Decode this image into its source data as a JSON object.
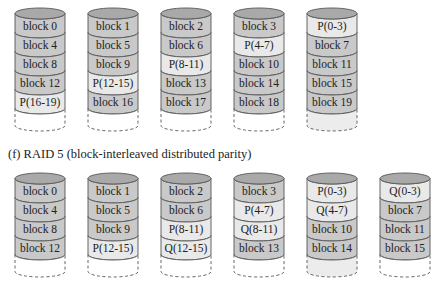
{
  "colors": {
    "data_block": "#c9c9c9",
    "parity_block": "#e9e9e9",
    "cap": "#a9a9a9",
    "outline": "#555555",
    "empty": "#ffffff",
    "empty_parity": "#ececec"
  },
  "raid5": {
    "disks": [
      {
        "blocks": [
          {
            "label": "block 0",
            "type": "data"
          },
          {
            "label": "block 4",
            "type": "data"
          },
          {
            "label": "block 8",
            "type": "data"
          },
          {
            "label": "block 12",
            "type": "data"
          },
          {
            "label": "P(16-19)",
            "type": "parity"
          }
        ],
        "tail": "empty"
      },
      {
        "blocks": [
          {
            "label": "block 1",
            "type": "data"
          },
          {
            "label": "block 5",
            "type": "data"
          },
          {
            "label": "block 9",
            "type": "data"
          },
          {
            "label": "P(12-15)",
            "type": "parity"
          },
          {
            "label": "block 16",
            "type": "data"
          }
        ],
        "tail": "empty"
      },
      {
        "blocks": [
          {
            "label": "block 2",
            "type": "data"
          },
          {
            "label": "block 6",
            "type": "data"
          },
          {
            "label": "P(8-11)",
            "type": "parity"
          },
          {
            "label": "block 13",
            "type": "data"
          },
          {
            "label": "block 17",
            "type": "data"
          }
        ],
        "tail": "empty"
      },
      {
        "blocks": [
          {
            "label": "block 3",
            "type": "data"
          },
          {
            "label": "P(4-7)",
            "type": "parity"
          },
          {
            "label": "block 10",
            "type": "data"
          },
          {
            "label": "block 14",
            "type": "data"
          },
          {
            "label": "block 18",
            "type": "data"
          }
        ],
        "tail": "empty"
      },
      {
        "blocks": [
          {
            "label": "P(0-3)",
            "type": "parity"
          },
          {
            "label": "block 7",
            "type": "data"
          },
          {
            "label": "block 11",
            "type": "data"
          },
          {
            "label": "block 15",
            "type": "data"
          },
          {
            "label": "block 19",
            "type": "data"
          }
        ],
        "tail": "parity"
      }
    ]
  },
  "caption": "(f) RAID 5 (block-interleaved distributed parity)",
  "raid6": {
    "disks": [
      {
        "blocks": [
          {
            "label": "block 0",
            "type": "data"
          },
          {
            "label": "block 4",
            "type": "data"
          },
          {
            "label": "block 8",
            "type": "data"
          },
          {
            "label": "block 12",
            "type": "data"
          }
        ],
        "tail": "empty"
      },
      {
        "blocks": [
          {
            "label": "block 1",
            "type": "data"
          },
          {
            "label": "block 5",
            "type": "data"
          },
          {
            "label": "block 9",
            "type": "data"
          },
          {
            "label": "P(12-15)",
            "type": "parity"
          }
        ],
        "tail": "empty"
      },
      {
        "blocks": [
          {
            "label": "block 2",
            "type": "data"
          },
          {
            "label": "block 6",
            "type": "data"
          },
          {
            "label": "P(8-11)",
            "type": "parity"
          },
          {
            "label": "Q(12-15)",
            "type": "parity"
          }
        ],
        "tail": "empty"
      },
      {
        "blocks": [
          {
            "label": "block 3",
            "type": "data"
          },
          {
            "label": "P(4-7)",
            "type": "parity"
          },
          {
            "label": "Q(8-11)",
            "type": "parity"
          },
          {
            "label": "block 13",
            "type": "data"
          }
        ],
        "tail": "empty"
      },
      {
        "blocks": [
          {
            "label": "P(0-3)",
            "type": "parity"
          },
          {
            "label": "Q(4-7)",
            "type": "parity"
          },
          {
            "label": "block 10",
            "type": "data"
          },
          {
            "label": "block 14",
            "type": "data"
          }
        ],
        "tail": "parity"
      },
      {
        "blocks": [
          {
            "label": "Q(0-3)",
            "type": "parity"
          },
          {
            "label": "block 7",
            "type": "data"
          },
          {
            "label": "block 11",
            "type": "data"
          },
          {
            "label": "block 15",
            "type": "data"
          }
        ],
        "tail": "empty"
      }
    ]
  }
}
